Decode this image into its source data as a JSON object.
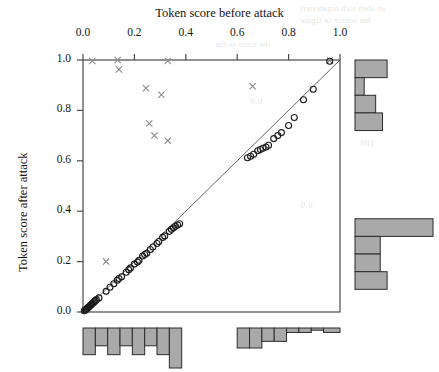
{
  "figure": {
    "xlabel_top": "Token score before attack",
    "ylabel_left": "Token score after attack"
  },
  "bleed_text": [
    {
      "text": "an oben sich organisiert",
      "x": 300,
      "y": 4,
      "size": 8
    },
    {
      "text": "bar source in figure",
      "x": 300,
      "y": 16,
      "size": 8
    },
    {
      "text": "the score to the",
      "x": 215,
      "y": 40,
      "size": 8
    },
    {
      "text": "0.0",
      "x": 250,
      "y": 96,
      "size": 9
    },
    {
      "text": "100",
      "x": 360,
      "y": 138,
      "size": 9
    },
    {
      "text": "0.0",
      "x": 300,
      "y": 200,
      "size": 9
    }
  ],
  "chart_data": {
    "type": "scatter",
    "title": "",
    "xlabel": "Token score before attack",
    "ylabel": "Token score after attack",
    "xlim": [
      0.0,
      1.0
    ],
    "ylim": [
      0.0,
      1.0
    ],
    "xticks": [
      0.0,
      0.2,
      0.4,
      0.6,
      0.8,
      1.0
    ],
    "yticks": [
      0.0,
      0.2,
      0.4,
      0.6,
      0.8,
      1.0
    ],
    "xtick_labels": [
      "0.0",
      "0.2",
      "0.4",
      "0.6",
      "0.8",
      "1.0"
    ],
    "ytick_labels": [
      "0.0",
      "0.2",
      "0.4",
      "0.6",
      "0.8",
      "1.0"
    ],
    "x_axis_position": "top",
    "y_axis_position": "left",
    "grid": false,
    "legend": false,
    "reference_line": {
      "type": "identity",
      "from": [
        0.0,
        0.0
      ],
      "to": [
        1.0,
        1.0
      ]
    },
    "series": [
      {
        "name": "unchanged",
        "marker": "circle",
        "color": "#1a1a1a",
        "fill": "none",
        "points": [
          [
            0.005,
            0.005
          ],
          [
            0.01,
            0.008
          ],
          [
            0.013,
            0.012
          ],
          [
            0.016,
            0.014
          ],
          [
            0.019,
            0.018
          ],
          [
            0.022,
            0.02
          ],
          [
            0.026,
            0.024
          ],
          [
            0.029,
            0.027
          ],
          [
            0.033,
            0.03
          ],
          [
            0.036,
            0.034
          ],
          [
            0.04,
            0.037
          ],
          [
            0.044,
            0.041
          ],
          [
            0.048,
            0.045
          ],
          [
            0.052,
            0.049
          ],
          [
            0.062,
            0.056
          ],
          [
            0.09,
            0.082
          ],
          [
            0.105,
            0.098
          ],
          [
            0.12,
            0.112
          ],
          [
            0.133,
            0.126
          ],
          [
            0.14,
            0.133
          ],
          [
            0.15,
            0.14
          ],
          [
            0.168,
            0.158
          ],
          [
            0.178,
            0.168
          ],
          [
            0.185,
            0.175
          ],
          [
            0.2,
            0.19
          ],
          [
            0.212,
            0.198
          ],
          [
            0.218,
            0.205
          ],
          [
            0.232,
            0.222
          ],
          [
            0.24,
            0.228
          ],
          [
            0.248,
            0.233
          ],
          [
            0.262,
            0.248
          ],
          [
            0.272,
            0.258
          ],
          [
            0.288,
            0.272
          ],
          [
            0.295,
            0.28
          ],
          [
            0.31,
            0.296
          ],
          [
            0.318,
            0.302
          ],
          [
            0.336,
            0.32
          ],
          [
            0.344,
            0.328
          ],
          [
            0.352,
            0.334
          ],
          [
            0.36,
            0.34
          ],
          [
            0.368,
            0.345
          ],
          [
            0.376,
            0.35
          ],
          [
            0.64,
            0.612
          ],
          [
            0.652,
            0.618
          ],
          [
            0.664,
            0.626
          ],
          [
            0.68,
            0.64
          ],
          [
            0.69,
            0.645
          ],
          [
            0.7,
            0.65
          ],
          [
            0.712,
            0.655
          ],
          [
            0.722,
            0.662
          ],
          [
            0.742,
            0.688
          ],
          [
            0.758,
            0.7
          ],
          [
            0.772,
            0.712
          ],
          [
            0.8,
            0.74
          ],
          [
            0.822,
            0.772
          ],
          [
            0.858,
            0.842
          ],
          [
            0.896,
            0.884
          ],
          [
            0.96,
            0.995
          ]
        ]
      },
      {
        "name": "degraded",
        "marker": "x",
        "color": "#8a8a8a",
        "points": [
          [
            0.036,
            0.996
          ],
          [
            0.135,
            1.0
          ],
          [
            0.14,
            0.962
          ],
          [
            0.33,
            0.996
          ],
          [
            0.96,
            0.998
          ],
          [
            0.245,
            0.888
          ],
          [
            0.305,
            0.862
          ],
          [
            0.66,
            0.896
          ],
          [
            0.258,
            0.748
          ],
          [
            0.278,
            0.7
          ],
          [
            0.33,
            0.68
          ],
          [
            0.09,
            0.2
          ]
        ]
      }
    ],
    "marginal_top_x_histogram": {
      "position": "bottom",
      "orientation": "vertical-down",
      "bins": [
        {
          "x0": 0.0,
          "x1": 0.048,
          "count": 12
        },
        {
          "x0": 0.048,
          "x1": 0.096,
          "count": 8
        },
        {
          "x0": 0.096,
          "x1": 0.144,
          "count": 12
        },
        {
          "x0": 0.144,
          "x1": 0.192,
          "count": 8
        },
        {
          "x0": 0.192,
          "x1": 0.24,
          "count": 12
        },
        {
          "x0": 0.24,
          "x1": 0.288,
          "count": 8
        },
        {
          "x0": 0.288,
          "x1": 0.336,
          "count": 12
        },
        {
          "x0": 0.336,
          "x1": 0.384,
          "count": 18
        },
        {
          "x0": 0.384,
          "x1": 0.6,
          "count": 0
        },
        {
          "x0": 0.6,
          "x1": 0.648,
          "count": 9
        },
        {
          "x0": 0.648,
          "x1": 0.696,
          "count": 9
        },
        {
          "x0": 0.696,
          "x1": 0.744,
          "count": 6
        },
        {
          "x0": 0.744,
          "x1": 0.792,
          "count": 6
        },
        {
          "x0": 0.792,
          "x1": 0.84,
          "count": 2
        },
        {
          "x0": 0.84,
          "x1": 0.888,
          "count": 2
        },
        {
          "x0": 0.888,
          "x1": 0.936,
          "count": 1
        },
        {
          "x0": 0.936,
          "x1": 1.0,
          "count": 2
        }
      ]
    },
    "marginal_right_y_histogram": {
      "position": "right",
      "orientation": "horizontal-right",
      "bins": [
        {
          "y0": 0.93,
          "y1": 1.0,
          "count": 14
        },
        {
          "y0": 0.86,
          "y1": 0.93,
          "count": 4
        },
        {
          "y0": 0.79,
          "y1": 0.86,
          "count": 9
        },
        {
          "y0": 0.72,
          "y1": 0.79,
          "count": 12
        },
        {
          "y0": 0.65,
          "y1": 0.72,
          "count": 0
        },
        {
          "y0": 0.3,
          "y1": 0.37,
          "count": 34
        },
        {
          "y0": 0.23,
          "y1": 0.3,
          "count": 11
        },
        {
          "y0": 0.16,
          "y1": 0.23,
          "count": 11
        },
        {
          "y0": 0.09,
          "y1": 0.16,
          "count": 14
        }
      ]
    }
  },
  "style": {
    "histogram_fill": "#a9a9a9",
    "histogram_stroke": "#2b2b2b",
    "frame_color": "#4a4a4a",
    "circle_color": "#1a1a1a",
    "cross_color": "#8a8a8a",
    "line_color": "#555555",
    "background": "#ffffff"
  }
}
